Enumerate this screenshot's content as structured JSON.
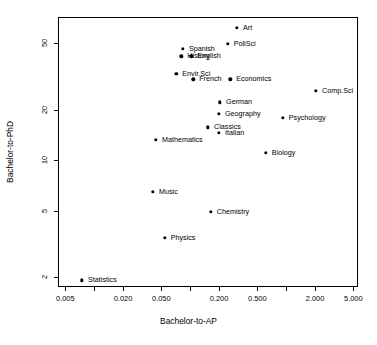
{
  "chart_data": {
    "type": "scatter",
    "title": "",
    "xlabel": "Bachelor-to-AP",
    "ylabel": "Bachelor-to-PhD",
    "xscale": "log",
    "yscale": "log",
    "xlim": [
      0.0042,
      5.6
    ],
    "ylim": [
      1.75,
      72
    ],
    "grid": false,
    "legend": "none",
    "xticks": [
      0.005,
      0.01,
      0.02,
      0.05,
      0.1,
      0.2,
      0.5,
      1.0,
      2.0,
      5.0
    ],
    "xticklabels": [
      "0.005",
      "",
      "0.020",
      "0.050",
      "",
      "0.200",
      "0.500",
      "",
      "2.000",
      "5.000"
    ],
    "yticks": [
      2,
      5,
      10,
      20,
      50
    ],
    "yticklabels": [
      "2",
      "5",
      "10",
      "20",
      "50"
    ],
    "points": [
      {
        "label": "Art",
        "x": 0.3,
        "y": 63.0,
        "lx": 6,
        "ly": 0
      },
      {
        "label": "PoliSci",
        "x": 0.24,
        "y": 50.5,
        "lx": 6,
        "ly": 0
      },
      {
        "label": "Spanish",
        "x": 0.082,
        "y": 47.0,
        "lx": 6,
        "ly": 0
      },
      {
        "label": "History",
        "x": 0.079,
        "y": 42.5,
        "lx": 6,
        "ly": 0
      },
      {
        "label": "English",
        "x": 0.1,
        "y": 42.5,
        "lx": 6,
        "ly": 0
      },
      {
        "label": "Envir.Sci",
        "x": 0.07,
        "y": 33.5,
        "lx": 6,
        "ly": 0
      },
      {
        "label": "French",
        "x": 0.105,
        "y": 31.0,
        "lx": 6,
        "ly": 0
      },
      {
        "label": "Economics",
        "x": 0.255,
        "y": 31.0,
        "lx": 6,
        "ly": 0
      },
      {
        "label": "Comp.Sci",
        "x": 2.0,
        "y": 26.5,
        "lx": 6,
        "ly": 0
      },
      {
        "label": "German",
        "x": 0.2,
        "y": 22.5,
        "lx": 6,
        "ly": 0
      },
      {
        "label": "Geography",
        "x": 0.195,
        "y": 19.3,
        "lx": 6,
        "ly": 0
      },
      {
        "label": "Psychology",
        "x": 0.9,
        "y": 18.2,
        "lx": 6,
        "ly": 0
      },
      {
        "label": "Classics",
        "x": 0.15,
        "y": 16.0,
        "lx": 6,
        "ly": 0
      },
      {
        "label": "Italian",
        "x": 0.195,
        "y": 14.8,
        "lx": 6,
        "ly": 0
      },
      {
        "label": "Mathematics",
        "x": 0.043,
        "y": 13.5,
        "lx": 6,
        "ly": 0
      },
      {
        "label": "Biology",
        "x": 0.6,
        "y": 11.3,
        "lx": 6,
        "ly": 0
      },
      {
        "label": "Music",
        "x": 0.04,
        "y": 6.6,
        "lx": 6,
        "ly": 0
      },
      {
        "label": "Chemistry",
        "x": 0.16,
        "y": 5.0,
        "lx": 6,
        "ly": 0
      },
      {
        "label": "Physics",
        "x": 0.053,
        "y": 3.5,
        "lx": 6,
        "ly": 0
      },
      {
        "label": "Statistics",
        "x": 0.0073,
        "y": 1.95,
        "lx": 6,
        "ly": 0
      }
    ]
  }
}
